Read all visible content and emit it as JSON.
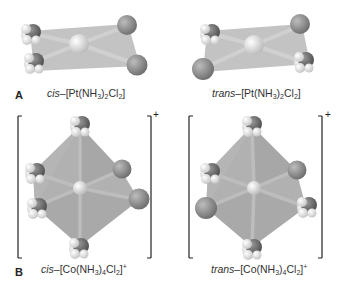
{
  "figure": {
    "panel_a": {
      "letter": "A",
      "left": {
        "isomer": "cis",
        "dash": "–[Pt(NH",
        "sub1": "3",
        "mid": ")",
        "sub2": "2",
        "cl": "Cl",
        "sub3": "2",
        "end": "]",
        "charge": ""
      },
      "right": {
        "isomer": "trans",
        "dash": "–[Pt(NH",
        "sub1": "3",
        "mid": ")",
        "sub2": "2",
        "cl": "Cl",
        "sub3": "2",
        "end": "]",
        "charge": ""
      }
    },
    "panel_b": {
      "letter": "B",
      "bracket_charge_left": "+",
      "bracket_charge_right": "+",
      "left": {
        "isomer": "cis",
        "dash": "–[Co(NH",
        "sub1": "3",
        "mid": ")",
        "sub2": "4",
        "cl": "Cl",
        "sub3": "2",
        "end": "]",
        "charge": "+"
      },
      "right": {
        "isomer": "trans",
        "dash": "–[Co(NH",
        "sub1": "3",
        "mid": ")",
        "sub2": "4",
        "cl": "Cl",
        "sub3": "2",
        "end": "]",
        "charge": "+"
      }
    },
    "colors": {
      "plane": "#b9b9b9",
      "octahedron": "#a9a9a9",
      "metal": "#d8d8d8",
      "chlorine": "#8f8f8f",
      "nitrogen": "#6f6f6f",
      "hydrogen": "#e6e6e6",
      "bond": "#c8c8c8"
    }
  }
}
